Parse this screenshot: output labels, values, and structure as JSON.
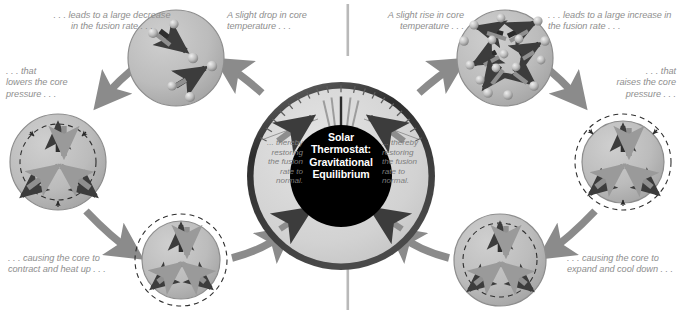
{
  "diagram": {
    "title": "Solar Thermostat: Gravitational Equilibrium",
    "center": {
      "label": "Solar\nThermostat:\nGravitational\nEquilibrium",
      "text_color": "#ffffff",
      "disc_color": "#000000"
    },
    "dial": {
      "left_note": "... thereby\nrestoring\nthe fusion\nrate to\nnormal.",
      "right_note": "... thereby\nrestoring\nthe fusion\nrate to\nnormal.",
      "tick_count": 19,
      "needle_count": 5
    },
    "left_cycle": {
      "name": "cooling-cycle",
      "steps": [
        {
          "id": "left-temp-drop",
          "caption": "A slight drop in core\ntemperature . . ."
        },
        {
          "id": "left-fusion-decrease",
          "caption": ". . . leads to a large decrease\nin the fusion rate . . ."
        },
        {
          "id": "left-pressure-lower",
          "caption": ". . . that\nlowers the core\npressure . . ."
        },
        {
          "id": "left-contract",
          "caption": ". . . causing the core to\ncontract and heat up . . ."
        }
      ]
    },
    "right_cycle": {
      "name": "heating-cycle",
      "steps": [
        {
          "id": "right-temp-rise",
          "caption": "A slight rise in core\ntemperature . . ."
        },
        {
          "id": "right-fusion-increase",
          "caption": ". . . leads to a large increase in\nthe fusion rate . . ."
        },
        {
          "id": "right-pressure-raise",
          "caption": ". . . that\nraises the core\npressure . . ."
        },
        {
          "id": "right-expand",
          "caption": ". . . causing the core to\nexpand and cool down . . ."
        }
      ]
    },
    "colors": {
      "caption_text": "#8e8e8e",
      "dial_note_text": "#7d7d7d",
      "sphere_fill": "#b4b4b4",
      "sphere_stroke": "#8a8a8a",
      "dial_face": "#d6d6d6",
      "dial_rim": "#3a3a3a",
      "arrow_dark": "#3c3c3c",
      "arrow_gray": "#9a9a9a",
      "divider": "#bdbdbd",
      "background": "#ffffff"
    }
  }
}
